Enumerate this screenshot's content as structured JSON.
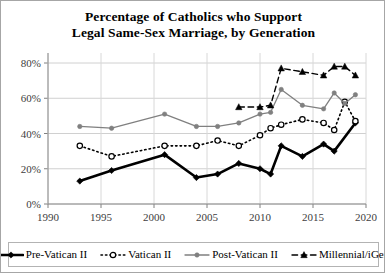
{
  "chart_data": {
    "type": "line",
    "title": "Percentage of Catholics who Support Legal Same-Sex Marriage, by Generation",
    "title_lines": [
      "Percentage of Catholics who Support",
      "Legal Same-Sex Marriage, by Generation"
    ],
    "xlabel": "",
    "ylabel": "",
    "xlim": [
      1990,
      2020
    ],
    "ylim": [
      0,
      80
    ],
    "x_ticks": [
      1990,
      1995,
      2000,
      2005,
      2010,
      2015,
      2020
    ],
    "x_tick_labels": [
      "1990",
      "1995",
      "2000",
      "2005",
      "2010",
      "2015",
      "2020"
    ],
    "y_ticks": [
      0,
      20,
      40,
      60,
      80
    ],
    "y_tick_labels": [
      "0%",
      "20%",
      "40%",
      "60%",
      "80%"
    ],
    "grid": true,
    "legend_position": "bottom",
    "series": [
      {
        "name": "Pre-Vatican II",
        "marker": "diamond-filled",
        "color": "#000000",
        "line_style": "solid",
        "line_width": 2.6,
        "points": [
          {
            "x": 1993,
            "y": 13
          },
          {
            "x": 1996,
            "y": 19
          },
          {
            "x": 2001,
            "y": 28
          },
          {
            "x": 2004,
            "y": 15
          },
          {
            "x": 2006,
            "y": 17
          },
          {
            "x": 2008,
            "y": 23
          },
          {
            "x": 2010,
            "y": 20
          },
          {
            "x": 2011,
            "y": 17
          },
          {
            "x": 2012,
            "y": 33
          },
          {
            "x": 2014,
            "y": 27
          },
          {
            "x": 2016,
            "y": 34
          },
          {
            "x": 2017,
            "y": 30
          },
          {
            "x": 2019,
            "y": 46
          }
        ]
      },
      {
        "name": "Vatican II",
        "marker": "circle-open",
        "color": "#000000",
        "line_style": "dotted",
        "line_width": 1.6,
        "points": [
          {
            "x": 1993,
            "y": 33
          },
          {
            "x": 1996,
            "y": 27
          },
          {
            "x": 2001,
            "y": 33
          },
          {
            "x": 2004,
            "y": 33
          },
          {
            "x": 2006,
            "y": 36
          },
          {
            "x": 2008,
            "y": 33
          },
          {
            "x": 2010,
            "y": 39
          },
          {
            "x": 2011,
            "y": 43
          },
          {
            "x": 2012,
            "y": 45
          },
          {
            "x": 2014,
            "y": 48
          },
          {
            "x": 2016,
            "y": 46
          },
          {
            "x": 2017,
            "y": 42
          },
          {
            "x": 2018,
            "y": 58
          },
          {
            "x": 2019,
            "y": 47
          }
        ]
      },
      {
        "name": "Post-Vatican II",
        "marker": "circle-filled",
        "color": "#808080",
        "line_style": "solid",
        "line_width": 1.3,
        "points": [
          {
            "x": 1993,
            "y": 44
          },
          {
            "x": 1996,
            "y": 43
          },
          {
            "x": 2001,
            "y": 51
          },
          {
            "x": 2004,
            "y": 44
          },
          {
            "x": 2006,
            "y": 44
          },
          {
            "x": 2008,
            "y": 46
          },
          {
            "x": 2010,
            "y": 51
          },
          {
            "x": 2011,
            "y": 52
          },
          {
            "x": 2012,
            "y": 65
          },
          {
            "x": 2014,
            "y": 56
          },
          {
            "x": 2016,
            "y": 54
          },
          {
            "x": 2017,
            "y": 63
          },
          {
            "x": 2018,
            "y": 57
          },
          {
            "x": 2019,
            "y": 62
          }
        ]
      },
      {
        "name": "Millennial/iGen",
        "marker": "triangle-filled",
        "color": "#000000",
        "line_style": "dashed",
        "line_width": 1.4,
        "points": [
          {
            "x": 2008,
            "y": 55
          },
          {
            "x": 2010,
            "y": 55
          },
          {
            "x": 2011,
            "y": 56
          },
          {
            "x": 2012,
            "y": 77
          },
          {
            "x": 2014,
            "y": 75
          },
          {
            "x": 2016,
            "y": 73
          },
          {
            "x": 2017,
            "y": 78
          },
          {
            "x": 2018,
            "y": 78
          },
          {
            "x": 2019,
            "y": 73
          }
        ]
      }
    ]
  },
  "legend": {
    "items": [
      {
        "label": "Pre-Vatican II"
      },
      {
        "label": "Vatican II"
      },
      {
        "label": "Post-Vatican II"
      },
      {
        "label": "Millennial/iGen"
      }
    ]
  }
}
